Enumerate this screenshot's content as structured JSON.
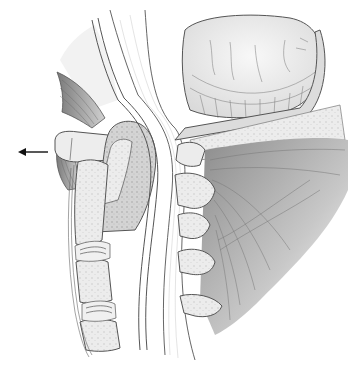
{
  "figure": {
    "type": "medical-illustration",
    "view": "midsagittal section of craniocervical junction",
    "annotations": [
      {
        "kind": "arrow",
        "direction": "left",
        "x1": 48,
        "y1": 152,
        "x2": 18,
        "y2": 152
      }
    ],
    "structures": [
      "cerebellum",
      "brainstem",
      "spinal-cord",
      "dens",
      "anterior-arch-of-atlas",
      "posterior-arch-of-atlas",
      "cervical-vertebral-bodies",
      "intervertebral-discs",
      "spinous-processes",
      "posterior-neck-muscles",
      "prevertebral-soft-tissue",
      "occipital-bone"
    ],
    "colors": {
      "outline": "#555555",
      "bone_fill": "#ececec",
      "muscle_shade": "#9a9a9a",
      "background": "#ffffff"
    }
  }
}
